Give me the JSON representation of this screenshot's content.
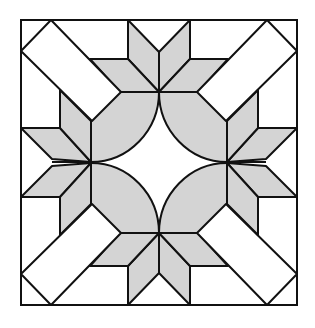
{
  "diagram": {
    "title": "Quilt block pattern",
    "colors": {
      "background": "#ffffff",
      "fill_gray": "#d4d4d4",
      "fill_white": "#ffffff",
      "stroke": "#111111"
    },
    "stroke_width": 2
  }
}
